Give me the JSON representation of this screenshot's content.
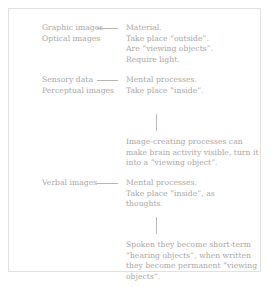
{
  "diagram": {
    "text_color": "#a9a6a2",
    "line_color": "#b9b6b2",
    "border_color": "#e3e1de",
    "background": "#ffffff",
    "rows": [
      {
        "id": "graphic",
        "label": "Graphic images\nOptical images",
        "body": "Material.\nTake place “outside”.\nAre “viewing objects”.\nRequire light.",
        "connector": "horizontal-dash"
      },
      {
        "id": "sensory",
        "label": "Sensory data\nPerceptual images",
        "body": "Mental processes.\nTake place “inside”.",
        "connector": "horizontal-dash"
      },
      {
        "id": "verbal",
        "label": "Verbal images",
        "body": "Mental processes.\nTake place “inside”, as\nthoughts.",
        "connector": "horizontal-dash"
      }
    ],
    "notes": [
      {
        "id": "note-1",
        "text": "Image-creating processes can make brain activity visible, turn it into a “viewing object”."
      },
      {
        "id": "note-2",
        "text": "Spoken they become short-term “hearing objects”, when written they become permanent “viewing objects”."
      }
    ],
    "ticks": [
      {
        "id": "tick-1",
        "orientation": "vertical"
      },
      {
        "id": "tick-2",
        "orientation": "vertical"
      }
    ]
  }
}
